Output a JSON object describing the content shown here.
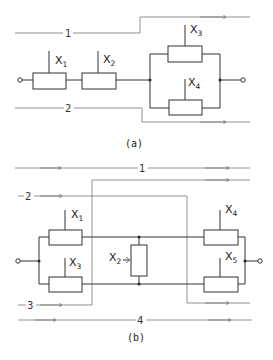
{
  "diagram_a": {
    "caption": "(a)",
    "elements": [
      {
        "name": "X",
        "sub": "1"
      },
      {
        "name": "X",
        "sub": "2"
      },
      {
        "name": "X",
        "sub": "3"
      },
      {
        "name": "X",
        "sub": "4"
      }
    ],
    "paths": [
      {
        "label": "1"
      },
      {
        "label": "2"
      }
    ]
  },
  "diagram_b": {
    "caption": "(b)",
    "elements": [
      {
        "name": "X",
        "sub": "1"
      },
      {
        "name": "X",
        "sub": "3"
      },
      {
        "name": "X",
        "sub": "2"
      },
      {
        "name": "X",
        "sub": "4"
      },
      {
        "name": "X",
        "sub": "5"
      }
    ],
    "paths": [
      {
        "label": "1"
      },
      {
        "label": "2"
      },
      {
        "label": "3"
      },
      {
        "label": "4"
      }
    ]
  },
  "colors": {
    "wire": "#333333",
    "path": "#777777",
    "background": "#ffffff"
  }
}
